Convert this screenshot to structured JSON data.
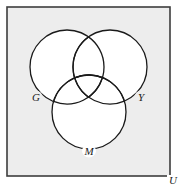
{
  "diagram": {
    "type": "venn-3-set",
    "title": "",
    "universe": {
      "label": "U",
      "fill_color": "#ededed",
      "stroke_color": "#3d3d3d",
      "x": 7,
      "y": 7,
      "width": 163,
      "height": 169,
      "label_x": 173,
      "label_y": 184
    },
    "page_background": "#ffffff",
    "circle_fill": "#ffffff",
    "circle_stroke": "#1a1a1a",
    "sets": [
      {
        "label": "G",
        "name": "green-set",
        "cx": 67,
        "cy": 67,
        "r": 37,
        "label_x": 36,
        "label_y": 101
      },
      {
        "label": "Y",
        "name": "yellow-set",
        "cx": 110,
        "cy": 67,
        "r": 37,
        "label_x": 141,
        "label_y": 101
      },
      {
        "label": "M",
        "name": "magenta-set",
        "cx": 89,
        "cy": 112,
        "r": 37,
        "label_x": 89,
        "label_y": 155
      }
    ]
  }
}
